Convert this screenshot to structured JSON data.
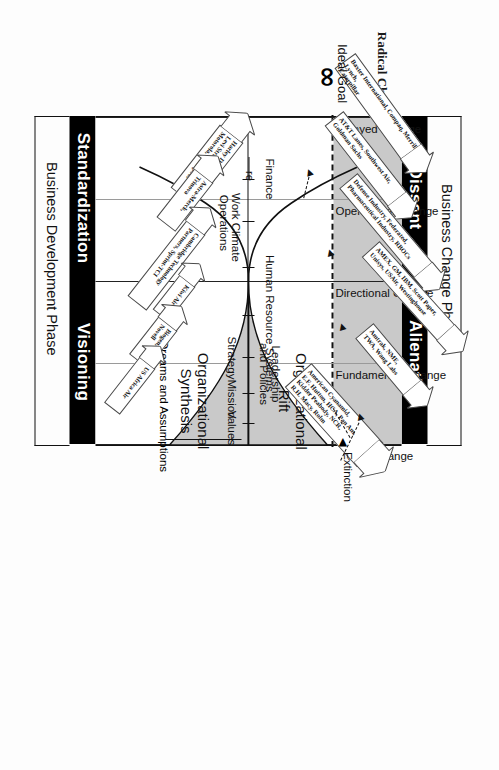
{
  "figure": {
    "caption_line1": "Figure 1",
    "caption_line2": "Radical Change and the Business Change Cycle"
  },
  "brackets": {
    "top_label": "Business Change Phase",
    "bottom_label": "Business Development Phase"
  },
  "banners": {
    "dissent": "Dissent",
    "alienation": "Alienation",
    "standardization": "Standardization",
    "visioning": "Visioning"
  },
  "change_axis": [
    "Delayed Change",
    "Operational Change",
    "Directional Change",
    "Fundamental Change",
    "Total Change"
  ],
  "stages": [
    "Finance",
    "Work Climate",
    "Operations",
    "Human Resource Systems",
    "Strategy",
    "Leadership",
    "and Policies",
    "Mission",
    "Values"
  ],
  "stage_items": [
    {
      "label": "Finance",
      "two_line": false
    },
    {
      "label": "Work Climate",
      "two_line": false
    },
    {
      "label": "Operations",
      "two_line": false
    },
    {
      "label": "Human Resource Systems",
      "two_line": false
    },
    {
      "label": "Strategy",
      "two_line": false
    },
    {
      "label": "Leadership\nand Policies",
      "two_line": true
    },
    {
      "label": "Mission",
      "two_line": false
    },
    {
      "label": "Values",
      "two_line": false
    }
  ],
  "regions": {
    "rift_line1": "Organizational",
    "rift_line2": "Rift",
    "synthesis_line1": "Organizational",
    "synthesis_line2": "Synthesis"
  },
  "endpoints": {
    "ideal_goal": "Ideal Goal",
    "infinity_symbol": "∞",
    "structure_fragment": "re",
    "extinction": "Extinction",
    "dreams": "Dreams and Assumptions"
  },
  "callouts": [
    {
      "id": "baxter",
      "text": "Baxter International, Compaq, Merrill Lynch,\nCaterpillar"
    },
    {
      "id": "att",
      "text": "AT&T Lanes, Southwest Air,\nGoldman Sachs"
    },
    {
      "id": "defense",
      "text": "Defense Industry, Federated,\nPharmaceutical Industry, RBOCs"
    },
    {
      "id": "amex",
      "text": "AMEX, GM, IBM, Scott Paper,\nUnisys, USAir, Westinghouse"
    },
    {
      "id": "amtrak",
      "text": "Amtrak, NME,\nTWA, Wang Labs"
    },
    {
      "id": "cyanamid",
      "text": "American Cyanamid,\nE.F. Hutton, HCA, Pan Am,\nKidder Peabody, NCR,\nR.H. Macy, Rolm"
    },
    {
      "id": "harley",
      "text": "Harley Davidson,\nLevi Strauss, MCI,\nMotorola, Whirlpool"
    },
    {
      "id": "astra",
      "text": "Astra-Merck,\nTrinova"
    },
    {
      "id": "cambridge",
      "text": "Cambridge Technology\nPartners, Sprint-TCI"
    },
    {
      "id": "kiwi",
      "text": "Kiwi Air"
    },
    {
      "id": "biogen",
      "text": "Biogen,\nNovell"
    },
    {
      "id": "usafrica",
      "text": "US Africa Air"
    }
  ],
  "colors": {
    "band_grey": "#c9c9c9",
    "cone_grey": "#c9c9c9",
    "banner_black": "#000000",
    "ink": "#111111",
    "paper": "#fdfdfd"
  }
}
